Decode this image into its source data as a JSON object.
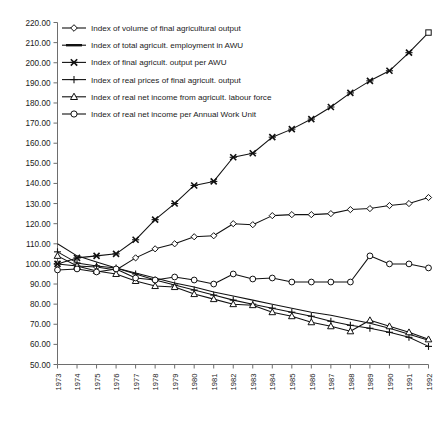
{
  "chart_data": {
    "type": "line",
    "title": "",
    "subtitle": "",
    "xlabel": "",
    "ylabel": "",
    "xlim": [
      1973,
      1992
    ],
    "ylim": [
      50.0,
      220.0
    ],
    "grid": false,
    "legend_position": "top-left",
    "y_ticks": [
      "220.00",
      "210.00",
      "200.00",
      "190.00",
      "180.00",
      "170.00",
      "160.00",
      "150.00",
      "140.00",
      "130.00",
      "120.00",
      "110.00",
      "100.00",
      "90.00",
      "80.00",
      "70.00",
      "60.00",
      "50.00"
    ],
    "y_tick_values": [
      220,
      210,
      200,
      190,
      180,
      170,
      160,
      150,
      140,
      130,
      120,
      110,
      100,
      90,
      80,
      70,
      60,
      50
    ],
    "categories": [
      "1973",
      "1974",
      "1975",
      "1976",
      "1977",
      "1978",
      "1979",
      "1980",
      "1981",
      "1982",
      "1983",
      "1984",
      "1985",
      "1986",
      "1987",
      "1988",
      "1989",
      "1990",
      "1991",
      "1992"
    ],
    "x": [
      1973,
      1974,
      1975,
      1976,
      1977,
      1978,
      1979,
      1980,
      1981,
      1982,
      1983,
      1984,
      1985,
      1986,
      1987,
      1988,
      1989,
      1990,
      1991,
      1992
    ],
    "series": [
      {
        "name": "Index of volume of final agricultural output",
        "marker": "diamond",
        "values": [
          100.0,
          99.0,
          98.5,
          97.0,
          103.0,
          107.5,
          110.0,
          113.5,
          114.0,
          120.0,
          119.5,
          124.0,
          124.5,
          124.5,
          125.0,
          127.0,
          127.5,
          129.0,
          130.0,
          133.0
        ]
      },
      {
        "name": "Index of total agricult. employment in AWU",
        "marker": "none",
        "values": [
          110.0,
          104.0,
          101.0,
          98.0,
          95.5,
          93.0,
          90.5,
          88.5,
          86.0,
          84.0,
          82.0,
          80.0,
          78.0,
          76.0,
          74.5,
          72.5,
          70.5,
          68.0,
          65.0,
          62.0
        ]
      },
      {
        "name": "Index of final agricult. output per AWU",
        "marker": "cross-x",
        "values": [
          100.0,
          103.0,
          104.0,
          105.0,
          112.0,
          122.0,
          130.0,
          139.0,
          141.0,
          153.0,
          155.0,
          163.0,
          167.0,
          172.0,
          178.0,
          185.0,
          191.0,
          196.0,
          205.0,
          215.0
        ]
      },
      {
        "name": "Index of real prices of final agricult. output",
        "marker": "plus",
        "values": [
          106.0,
          100.5,
          99.0,
          98.0,
          95.0,
          92.0,
          89.5,
          87.0,
          84.5,
          82.0,
          80.0,
          78.0,
          76.0,
          74.0,
          71.5,
          69.5,
          68.0,
          66.0,
          63.5,
          59.0
        ]
      },
      {
        "name": "Index of real net income from agricult. labour force",
        "marker": "triangle",
        "values": [
          104.0,
          99.0,
          96.5,
          95.0,
          91.5,
          89.0,
          88.5,
          85.0,
          82.5,
          80.0,
          79.5,
          76.0,
          74.0,
          71.0,
          69.0,
          66.5,
          72.0,
          69.0,
          66.0,
          62.5
        ]
      },
      {
        "name": "Index of real net income per Annual Work Unit",
        "marker": "circle",
        "values": [
          97.0,
          97.5,
          96.0,
          97.5,
          93.0,
          92.0,
          93.5,
          92.0,
          90.0,
          95.0,
          92.5,
          93.0,
          91.0,
          91.0,
          91.0,
          91.0,
          104.0,
          100.0,
          100.0,
          98.0
        ]
      }
    ]
  },
  "legend": {
    "items": [
      {
        "label": "Index of volume of final agricultural output",
        "marker": "diamond"
      },
      {
        "label": "Index of total agricult. employment in AWU",
        "marker": "none"
      },
      {
        "label": "Index of final agricult. output per AWU",
        "marker": "cross-x"
      },
      {
        "label": "Index of real prices of final agricult. output",
        "marker": "plus"
      },
      {
        "label": "Index of real net income from agricult. labour force",
        "marker": "triangle"
      },
      {
        "label": "Index of real net income per Annual Work Unit",
        "marker": "circle"
      }
    ]
  },
  "colors": {
    "line": "#111111",
    "axis": "#6e6e6e",
    "text": "#1a1a1a",
    "background": "#ffffff"
  }
}
